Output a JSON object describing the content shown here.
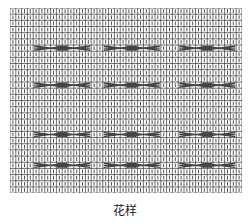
{
  "caption": "花样",
  "chart_data": {
    "type": "knitting-chart",
    "title": "花样",
    "columns": 40,
    "rows": 30,
    "cell_width": 5.8,
    "cell_height": 6.17,
    "cell_symbol": "knit-stitch-vertical-line",
    "cable_rows": [
      6,
      12,
      20,
      25
    ],
    "cable_groups": [
      {
        "start_col": 4,
        "width": 3
      },
      {
        "start_col": 8,
        "width": 3
      },
      {
        "start_col": 16,
        "width": 3
      },
      {
        "start_col": 20,
        "width": 3
      },
      {
        "start_col": 29,
        "width": 3
      },
      {
        "start_col": 33,
        "width": 3
      }
    ],
    "colors": {
      "grid": "#333333",
      "stitch": "#555555",
      "cable": "#444444",
      "background": "#ffffff"
    }
  }
}
